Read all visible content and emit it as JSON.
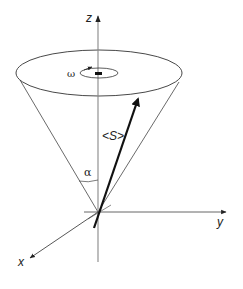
{
  "diagram": {
    "type": "precession-cone",
    "background": "#ffffff",
    "line_color": "#333333",
    "vector_color": "#111111",
    "axes": {
      "z": {
        "label": "z"
      },
      "y": {
        "label": "y"
      },
      "x": {
        "label": "x"
      }
    },
    "labels": {
      "omega": "ω",
      "spin_vector": "<S>",
      "cone_angle": "α"
    }
  }
}
